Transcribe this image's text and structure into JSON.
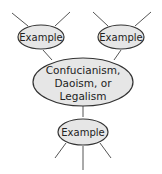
{
  "diagram": {
    "type": "web-diagram",
    "center": {
      "lines": [
        "Confucianism,",
        "Daoism, or",
        "Legalism"
      ]
    },
    "nodes": [
      {
        "id": "top-left",
        "label": "Example"
      },
      {
        "id": "top-right",
        "label": "Example"
      },
      {
        "id": "bottom",
        "label": "Example"
      }
    ],
    "colors": {
      "fill": "#e6e6e6",
      "stroke": "#333333",
      "line": "#555555",
      "text": "#222222"
    }
  }
}
